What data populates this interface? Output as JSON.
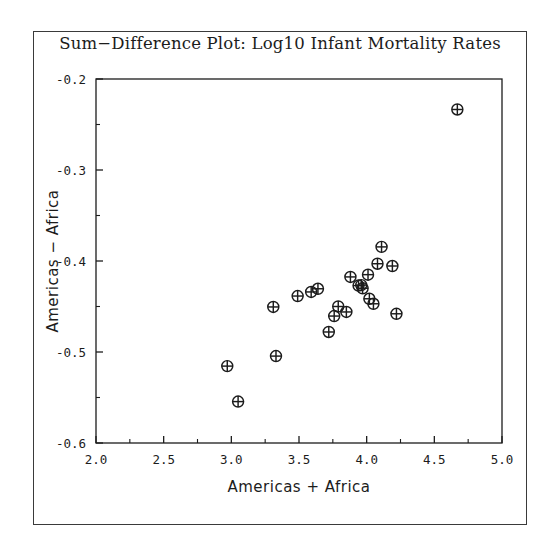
{
  "chart_data": {
    "type": "scatter",
    "title": "Sum−Difference Plot: Log10 Infant Mortality Rates",
    "xlabel": "Americas + Africa",
    "ylabel": "Americas − Africa",
    "xlim": [
      2.0,
      5.0
    ],
    "ylim": [
      -0.6,
      -0.2
    ],
    "xticks": [
      2.0,
      2.5,
      3.0,
      3.5,
      4.0,
      4.5,
      5.0
    ],
    "xtick_labels": [
      "2.0",
      "2.5",
      "3.0",
      "3.5",
      "4.0",
      "4.5",
      "5.0"
    ],
    "yticks": [
      -0.2,
      -0.3,
      -0.4,
      -0.5,
      -0.6
    ],
    "ytick_labels": [
      "-0.2",
      "-0.3",
      "-0.4",
      "-0.5",
      "-0.6"
    ],
    "x_minor_tick_step": 0.25,
    "y_minor_tick_step": 0.05,
    "grid": false,
    "legend": null,
    "marker": "circle-plus",
    "marker_size": 11,
    "marker_color": "#1c1c1c",
    "points": [
      {
        "x": 2.97,
        "y": -0.5155
      },
      {
        "x": 3.05,
        "y": -0.5545
      },
      {
        "x": 3.33,
        "y": -0.5045
      },
      {
        "x": 3.31,
        "y": -0.4505
      },
      {
        "x": 3.49,
        "y": -0.4385
      },
      {
        "x": 3.59,
        "y": -0.434
      },
      {
        "x": 3.64,
        "y": -0.4305
      },
      {
        "x": 3.72,
        "y": -0.478
      },
      {
        "x": 3.76,
        "y": -0.4605
      },
      {
        "x": 3.79,
        "y": -0.45
      },
      {
        "x": 3.85,
        "y": -0.456
      },
      {
        "x": 3.88,
        "y": -0.4175
      },
      {
        "x": 3.94,
        "y": -0.427
      },
      {
        "x": 3.96,
        "y": -0.4265
      },
      {
        "x": 3.97,
        "y": -0.43
      },
      {
        "x": 4.01,
        "y": -0.415
      },
      {
        "x": 4.02,
        "y": -0.4415
      },
      {
        "x": 4.05,
        "y": -0.447
      },
      {
        "x": 4.11,
        "y": -0.3845
      },
      {
        "x": 4.08,
        "y": -0.403
      },
      {
        "x": 4.19,
        "y": -0.4055
      },
      {
        "x": 4.22,
        "y": -0.458
      },
      {
        "x": 4.67,
        "y": -0.2335
      }
    ]
  },
  "figure": {
    "background_color": "#ffffff",
    "frame_color": "#3a3a3a",
    "axis_color": "#1c1c1c"
  }
}
